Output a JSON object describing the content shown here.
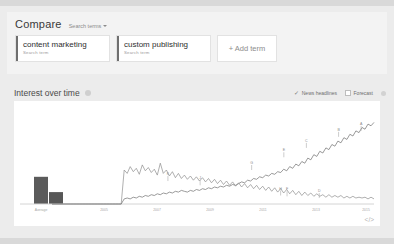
{
  "compare": {
    "title": "Compare",
    "dropdown_label": "Search terms",
    "dropdown_icon": "chevron-down-icon",
    "terms": [
      {
        "name": "content marketing",
        "subtitle": "Search term"
      },
      {
        "name": "custom publishing",
        "subtitle": "Search term"
      }
    ],
    "add_term_label": "+ Add term"
  },
  "interest_over_time": {
    "title": "Interest over time",
    "help_icon": "help-circle-icon",
    "toggles": [
      {
        "label": "News headlines",
        "checked": true,
        "icon": "check-icon"
      },
      {
        "label": "Forecast",
        "checked": false,
        "icon": "checkbox-icon"
      }
    ],
    "embed_icon": "code-embed-icon"
  },
  "colors": {
    "page_background": "#ececec",
    "card_background": "#f3f3f3",
    "chart_background": "#ffffff",
    "series_1": "#6f6f6f",
    "series_2": "#8e8e8e",
    "bar_fill": "#5b5b5b",
    "axis": "#d4d4d4",
    "marker": "#9a9a9a"
  },
  "chart_data": {
    "type": "line",
    "title": "Interest over time",
    "xlabel": "",
    "ylabel": "",
    "ylim": [
      0,
      100
    ],
    "grid": false,
    "legend_position": "top-right",
    "average_bars": {
      "label": "Average",
      "categories": [
        "content marketing",
        "custom publishing"
      ],
      "values": [
        32,
        14
      ]
    },
    "x_tick_labels": [
      "Average",
      "2005",
      "2007",
      "2009",
      "2011",
      "2013",
      "2015"
    ],
    "annotations": [
      {
        "label": "A",
        "x": 96,
        "y": 86,
        "series": "content marketing"
      },
      {
        "label": "B",
        "x": 89,
        "y": 79,
        "series": "content marketing"
      },
      {
        "label": "C",
        "x": 79,
        "y": 66,
        "series": "content marketing"
      },
      {
        "label": "E",
        "x": 72,
        "y": 55,
        "series": "content marketing"
      },
      {
        "label": "G",
        "x": 62,
        "y": 40,
        "series": "content marketing"
      },
      {
        "label": "D",
        "x": 83,
        "y": 7,
        "series": "custom publishing"
      },
      {
        "label": "F",
        "x": 73,
        "y": 9,
        "series": "custom publishing"
      },
      {
        "label": "H",
        "x": 71,
        "y": 10,
        "series": "custom publishing"
      },
      {
        "label": "J",
        "x": 46,
        "y": 22,
        "series": "custom publishing"
      },
      {
        "label": "K",
        "x": 36,
        "y": 27,
        "series": "custom publishing"
      }
    ],
    "series": [
      {
        "name": "content marketing",
        "color": "#6f6f6f",
        "values": [
          0,
          0,
          0,
          0,
          0,
          0,
          0,
          0,
          0,
          0,
          0,
          0,
          0,
          0,
          0,
          0,
          0,
          0,
          0,
          0,
          0,
          0,
          0,
          0,
          6,
          7,
          6,
          8,
          7,
          9,
          8,
          10,
          9,
          11,
          10,
          12,
          11,
          13,
          12,
          14,
          13,
          15,
          14,
          16,
          15,
          14,
          16,
          15,
          17,
          16,
          18,
          17,
          19,
          18,
          20,
          19,
          21,
          20,
          22,
          21,
          23,
          22,
          24,
          26,
          25,
          28,
          27,
          30,
          29,
          32,
          31,
          34,
          33,
          36,
          35,
          38,
          37,
          41,
          39,
          44,
          42,
          47,
          45,
          50,
          48,
          54,
          52,
          58,
          56,
          62,
          60,
          66,
          64,
          70,
          68,
          74,
          72,
          78,
          76,
          82,
          80,
          86,
          84,
          90,
          88,
          94,
          92,
          96
        ]
      },
      {
        "name": "custom publishing",
        "color": "#8e8e8e",
        "values": [
          0,
          0,
          0,
          0,
          0,
          0,
          0,
          0,
          0,
          0,
          0,
          0,
          0,
          0,
          0,
          0,
          0,
          0,
          0,
          0,
          0,
          0,
          0,
          0,
          40,
          36,
          44,
          38,
          42,
          35,
          46,
          39,
          43,
          37,
          41,
          34,
          48,
          36,
          40,
          33,
          38,
          31,
          36,
          30,
          34,
          29,
          33,
          28,
          32,
          27,
          31,
          26,
          30,
          25,
          29,
          24,
          28,
          23,
          27,
          22,
          26,
          21,
          25,
          20,
          24,
          19,
          23,
          18,
          22,
          17,
          21,
          16,
          20,
          15,
          19,
          14,
          18,
          13,
          17,
          12,
          16,
          11,
          15,
          10,
          14,
          10,
          13,
          9,
          12,
          9,
          11,
          8,
          11,
          8,
          10,
          8,
          10,
          7,
          9,
          7,
          9,
          7,
          8,
          7,
          8,
          6,
          8,
          6
        ]
      }
    ]
  }
}
